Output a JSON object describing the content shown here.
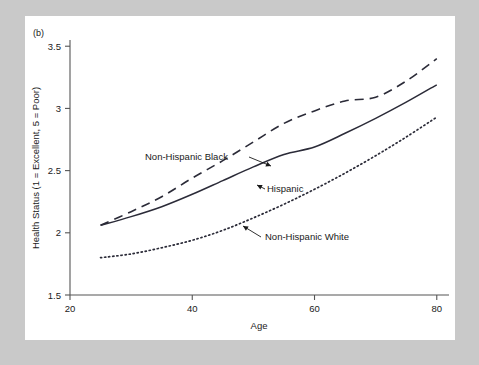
{
  "figure": {
    "panel_tag": "(b)",
    "background_color": "#c9c9c9",
    "panel_color": "#ffffff",
    "line_color": "#2b2b38",
    "axis_color": "#555555"
  },
  "chart_data": {
    "type": "line",
    "title": "",
    "xlabel": "Age",
    "ylabel": "Health Status (1 = Excellent, 5 = Poor)",
    "xlim": [
      20,
      82
    ],
    "ylim": [
      1.5,
      3.55
    ],
    "xticks": [
      20,
      40,
      60,
      80
    ],
    "xtick_labels": [
      "20",
      "40",
      "60",
      "80"
    ],
    "yticks": [
      1.5,
      2,
      2.5,
      3,
      3.5
    ],
    "ytick_labels": [
      "1.5",
      "2",
      "2.5",
      "3",
      "3.5"
    ],
    "grid": false,
    "legend": "inline-annotations",
    "x": [
      25,
      30,
      35,
      40,
      45,
      50,
      55,
      60,
      65,
      70,
      75,
      80
    ],
    "series": [
      {
        "name": "Non-Hispanic Black",
        "style": "dashed",
        "label": "Non-Hispanic Black",
        "values": [
          2.06,
          2.17,
          2.29,
          2.44,
          2.58,
          2.73,
          2.88,
          2.98,
          3.06,
          3.09,
          3.22,
          3.4
        ]
      },
      {
        "name": "Hispanic",
        "style": "solid",
        "label": "Hispanic",
        "values": [
          2.06,
          2.13,
          2.21,
          2.31,
          2.42,
          2.53,
          2.63,
          2.69,
          2.8,
          2.92,
          3.05,
          3.19
        ]
      },
      {
        "name": "Non-Hispanic White",
        "style": "dotted",
        "label": "Non-Hispanic White",
        "values": [
          1.8,
          1.83,
          1.88,
          1.94,
          2.02,
          2.12,
          2.23,
          2.35,
          2.48,
          2.62,
          2.77,
          2.93
        ]
      }
    ],
    "annotations": [
      {
        "text": "Non-Hispanic Black",
        "target_series": "Non-Hispanic Black"
      },
      {
        "text": "Hispanic",
        "target_series": "Hispanic"
      },
      {
        "text": "Non-Hispanic White",
        "target_series": "Non-Hispanic White"
      }
    ]
  }
}
